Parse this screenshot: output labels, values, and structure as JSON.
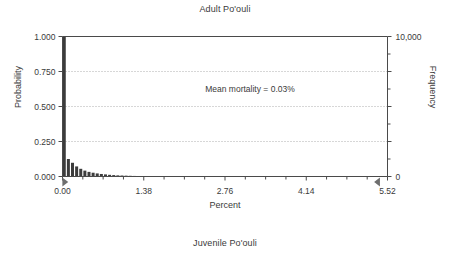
{
  "chart_data": {
    "type": "bar",
    "title": "Adult Po'ouli",
    "caption": "Juvenile Po'ouli",
    "xlabel": "Percent",
    "ylabel": "Probability",
    "ylabel_right": "Frequency",
    "annotation": "Mean mortality = 0.03%",
    "grid": true,
    "legend": "none",
    "xlim": [
      0,
      5.52
    ],
    "ylim": [
      0,
      1.0
    ],
    "ylim_right": [
      0,
      10000
    ],
    "xticks": [
      "0.00",
      "1.38",
      "2.76",
      "4.14",
      "5.52"
    ],
    "xtick_values": [
      0.0,
      1.38,
      2.76,
      4.14,
      5.52
    ],
    "yticks": [
      "0.000",
      "0.250",
      "0.500",
      "0.750",
      "1.000"
    ],
    "ytick_values": [
      0.0,
      0.25,
      0.5,
      0.75,
      1.0
    ],
    "yticks_right": [
      "0",
      "10,000"
    ],
    "ytick_right_values": [
      0,
      10000
    ],
    "x": [
      0.03,
      0.1,
      0.17,
      0.24,
      0.31,
      0.38,
      0.45,
      0.52,
      0.59,
      0.66,
      0.73,
      0.8,
      0.87,
      0.94,
      1.01,
      1.08,
      1.15,
      1.22
    ],
    "values": [
      1.0,
      0.125,
      0.098,
      0.072,
      0.055,
      0.042,
      0.033,
      0.027,
      0.022,
      0.018,
      0.015,
      0.012,
      0.01,
      0.008,
      0.007,
      0.006,
      0.005,
      0.004
    ],
    "markers": [
      {
        "name": "lower-bound-marker",
        "x": 0.04,
        "shape": "triangle-right"
      },
      {
        "name": "upper-bound-marker",
        "x": 5.35,
        "shape": "triangle-left"
      }
    ]
  }
}
